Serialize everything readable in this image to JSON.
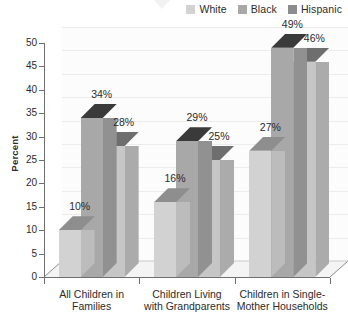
{
  "chart_data": {
    "type": "bar",
    "title": "",
    "subtitle": "",
    "xlabel": "",
    "ylabel": "Percent",
    "ylim": [
      0,
      50
    ],
    "ytick_step": 5,
    "yticks": [
      50,
      45,
      40,
      35,
      30,
      25,
      20,
      15,
      10,
      5,
      0
    ],
    "grid": true,
    "legend_position": "top-right",
    "style": "3d-clustered-column",
    "categories": [
      "All Children in\nFamilies",
      "Children Living\nwith Grandparents",
      "Children in Single-\nMother Households"
    ],
    "category_lines": [
      [
        "All Children in",
        "Families"
      ],
      [
        "Children Living",
        "with Grandparents"
      ],
      [
        "Children in Single-",
        "Mother Households"
      ]
    ],
    "series": [
      {
        "name": "White",
        "values": [
          10,
          16,
          27
        ],
        "labels": [
          "10%",
          "16%",
          "27%"
        ],
        "color": "#d2d2d2",
        "top_color": "#8e8e8e",
        "side_color": "#bcbcbc"
      },
      {
        "name": "Black",
        "values": [
          34,
          29,
          49
        ],
        "labels": [
          "34%",
          "29%",
          "49%"
        ],
        "color": "#a8a8a8",
        "top_color": "#3a3a3a",
        "side_color": "#919191"
      },
      {
        "name": "Hispanic",
        "values": [
          28,
          25,
          46
        ],
        "labels": [
          "28%",
          "25%",
          "46%"
        ],
        "color": "#c6c6c6",
        "top_color": "#6e6e6e",
        "side_color": "#ababab"
      }
    ]
  },
  "legend": {
    "items": [
      {
        "label": "White",
        "color": "#d2d2d2"
      },
      {
        "label": "Black",
        "color": "#a8a8a8"
      },
      {
        "label": "Hispanic",
        "color": "#8d8d8d"
      }
    ]
  },
  "axis": {
    "y_title": "Percent"
  },
  "colors": {
    "background": "#ffffff",
    "plot_background": "#fcfcfc",
    "gridline": "#ececec",
    "axis": "#6f6f6f",
    "text": "#2b2b2b",
    "floor": "#f4f4f4"
  }
}
